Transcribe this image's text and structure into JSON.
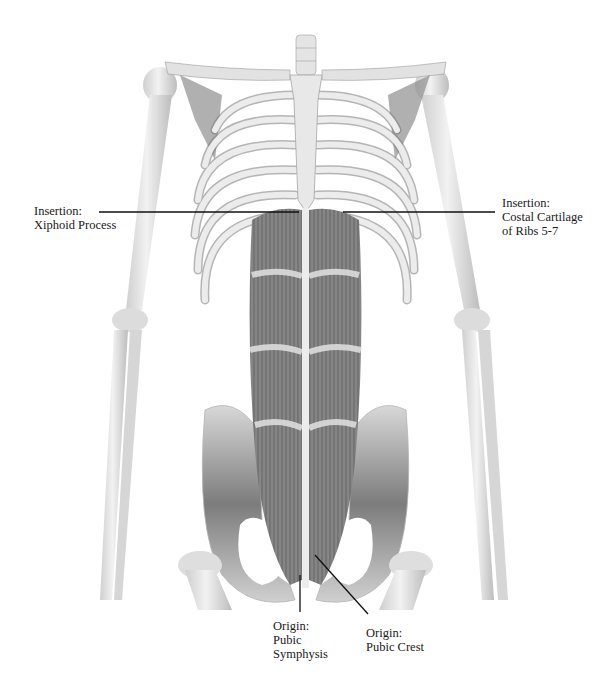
{
  "figure": {
    "colors": {
      "bone": "#e6e6e6",
      "bone_shadow": "#8a8a8a",
      "muscle": "#7a7a7a",
      "muscle_dark": "#4a4a4a",
      "leader_line": "#111111",
      "text": "#1a1a1a",
      "background": "#ffffff"
    }
  },
  "labels": {
    "xiphoid": {
      "line1": "Insertion:",
      "line2": "Xiphoid Process"
    },
    "costal": {
      "line1": "Insertion:",
      "line2": "Costal Cartilage",
      "line3": "of Ribs 5-7"
    },
    "symphysis": {
      "line1": "Origin:",
      "line2": "Pubic",
      "line3": "Symphysis"
    },
    "crest": {
      "line1": "Origin:",
      "line2": "Pubic Crest"
    }
  }
}
